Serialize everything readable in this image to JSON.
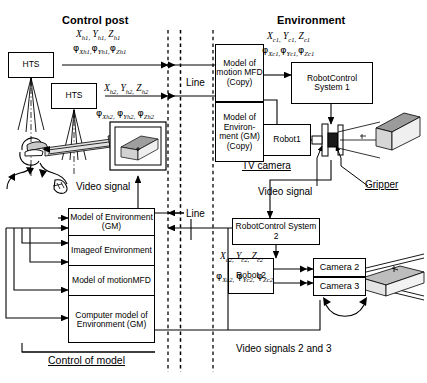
{
  "headers": {
    "control_post": "Control post",
    "environment": "Environment"
  },
  "channel": {
    "line_top": "Line",
    "line_bottom": "Line"
  },
  "control_post": {
    "hts1": "HTS",
    "hts2": "HTS",
    "coords_h1_pos": "X h1, Y h1, Z h1",
    "coords_h1_ang": "φXh1, φYh1, φZh1",
    "coords_h2_pos": "X h2, Y h2, Z h2",
    "coords_h2_ang": "φXh2, φYh2, φZh2",
    "video_signal": "Video signal",
    "model_stack": [
      "Model of Environment (GM)",
      "Imageof Environment",
      "Model of motionMFD",
      "Computer model of Environment (GM)"
    ],
    "control_of_model": "Control of model"
  },
  "environment": {
    "model_of_motion": "Model of motion MFD (Copy)",
    "model_of_env": "Model of Environ- ment (GM) (Copy)",
    "robot_control_1": "RobotControl System 1",
    "robot_control_2": "RobotControl System 2",
    "robot1": "Robot1",
    "robot2": "Robot 2",
    "camera2": "Camera 2",
    "camera3": "Camera 3",
    "tv_camera": "TV camera",
    "gripper": "Gripper",
    "video_signal": "Video signal",
    "video_signals_23": "Video signals 2 and 3",
    "coords_c1_pos": "X c1, Y c1, Z c1",
    "coords_c1_ang": "φXc1, φYc1, φZc1",
    "coords_c2_pos": "X c2, Y c2, Z c2",
    "coords_c2_ang": "φXc2, φYc2, φZc2"
  },
  "colors": {
    "stroke": "#000000",
    "background": "#ffffff",
    "fill_light": "#d9d9d9",
    "fill_mid": "#9a9a9a",
    "fill_dark": "#6b6b6b"
  },
  "icons": {
    "operator": "operator-hmd-icon",
    "monitor": "monitor-icon",
    "workpiece": "workpiece-3d-icon",
    "gripper": "gripper-icon",
    "camera_rig": "camera-rig-icon",
    "workpiece2": "workpiece-beams-icon"
  }
}
